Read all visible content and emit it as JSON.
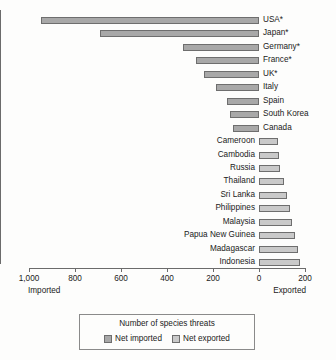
{
  "chart_data": {
    "type": "bar",
    "title": "",
    "subtitle": "",
    "orientation": "horizontal",
    "diverging": true,
    "xlabel": "",
    "ylabel": "",
    "xlim": [
      -1000,
      200
    ],
    "xticks": [
      -1000,
      -800,
      -600,
      -400,
      -200,
      0,
      200
    ],
    "xtick_labels": [
      "1,000",
      "800",
      "600",
      "400",
      "200",
      "0",
      "200"
    ],
    "grid": false,
    "legend_position": "bottom",
    "axis_end_labels": {
      "left": "Imported",
      "right": "Exported"
    },
    "legend": {
      "title": "Number of species threats",
      "entries": [
        {
          "name": "Net imported",
          "color": "#a8a8a8"
        },
        {
          "name": "Net exported",
          "color": "#c9c9c9"
        }
      ]
    },
    "categories": [
      "USA*",
      "Japan*",
      "Germany*",
      "France*",
      "UK*",
      "Italy",
      "Spain",
      "South Korea",
      "Canada",
      "Cameroon",
      "Cambodia",
      "Russia",
      "Thailand",
      "Sri Lanka",
      "Philippines",
      "Malaysia",
      "Papua New Guinea",
      "Madagascar",
      "Indonesia"
    ],
    "series": [
      {
        "name": "Net imported",
        "values": [
          950,
          690,
          330,
          275,
          240,
          185,
          140,
          125,
          115,
          0,
          0,
          0,
          0,
          0,
          0,
          0,
          0,
          0,
          0
        ]
      },
      {
        "name": "Net exported",
        "values": [
          0,
          0,
          0,
          0,
          0,
          0,
          0,
          0,
          0,
          82,
          85,
          90,
          110,
          122,
          135,
          143,
          158,
          168,
          180
        ]
      }
    ],
    "bars": [
      {
        "label": "USA*",
        "value": 950,
        "direction": "imported"
      },
      {
        "label": "Japan*",
        "value": 690,
        "direction": "imported"
      },
      {
        "label": "Germany*",
        "value": 330,
        "direction": "imported"
      },
      {
        "label": "France*",
        "value": 275,
        "direction": "imported"
      },
      {
        "label": "UK*",
        "value": 240,
        "direction": "imported"
      },
      {
        "label": "Italy",
        "value": 185,
        "direction": "imported"
      },
      {
        "label": "Spain",
        "value": 140,
        "direction": "imported"
      },
      {
        "label": "South Korea",
        "value": 125,
        "direction": "imported"
      },
      {
        "label": "Canada",
        "value": 115,
        "direction": "imported"
      },
      {
        "label": "Cameroon",
        "value": 82,
        "direction": "exported"
      },
      {
        "label": "Cambodia",
        "value": 85,
        "direction": "exported"
      },
      {
        "label": "Russia",
        "value": 90,
        "direction": "exported"
      },
      {
        "label": "Thailand",
        "value": 110,
        "direction": "exported"
      },
      {
        "label": "Sri Lanka",
        "value": 122,
        "direction": "exported"
      },
      {
        "label": "Philippines",
        "value": 135,
        "direction": "exported"
      },
      {
        "label": "Malaysia",
        "value": 143,
        "direction": "exported"
      },
      {
        "label": "Papua New Guinea",
        "value": 158,
        "direction": "exported"
      },
      {
        "label": "Madagascar",
        "value": 168,
        "direction": "exported"
      },
      {
        "label": "Indonesia",
        "value": 180,
        "direction": "exported"
      }
    ]
  }
}
